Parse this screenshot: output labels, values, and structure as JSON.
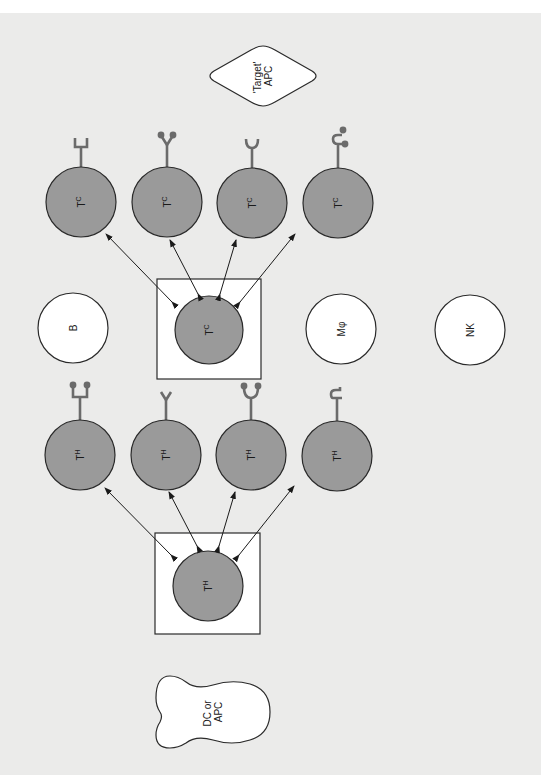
{
  "diagram": {
    "orientation": "rotated 90° clockwise (text reads bottom-to-top)",
    "colors": {
      "background": "#ebebea",
      "t_cell_fill": "#9a9a9a",
      "other_cell_fill": "#ffffff",
      "receptor": "#6b6b6b",
      "outline": "#2a2a2a"
    },
    "target_apc": {
      "line1": "'Target'",
      "line2": "APC"
    },
    "dc_apc": {
      "line1": "DC or",
      "line2": "APC"
    },
    "tc_group": {
      "precursor": {
        "main": "T",
        "sub": "C"
      },
      "progeny": [
        {
          "main": "T",
          "sub": "C",
          "receptor": "square-cup"
        },
        {
          "main": "T",
          "sub": "C",
          "receptor": "y-two-balls"
        },
        {
          "main": "T",
          "sub": "C",
          "receptor": "u-cup"
        },
        {
          "main": "T",
          "sub": "C",
          "receptor": "hook-two-balls"
        }
      ]
    },
    "th_group": {
      "precursor": {
        "main": "T",
        "sub": "H"
      },
      "progeny": [
        {
          "main": "T",
          "sub": "H",
          "receptor": "square-two-balls"
        },
        {
          "main": "T",
          "sub": "H",
          "receptor": "y-fork"
        },
        {
          "main": "T",
          "sub": "H",
          "receptor": "u-two-balls"
        },
        {
          "main": "T",
          "sub": "H",
          "receptor": "hook"
        }
      ]
    },
    "other_cells": [
      {
        "label": "B"
      },
      {
        "label": "Mφ"
      },
      {
        "label": "NK"
      }
    ]
  }
}
